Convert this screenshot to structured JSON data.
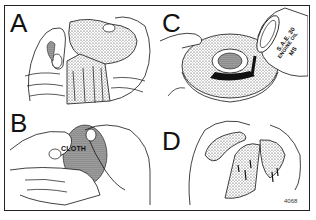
{
  "figure": {
    "panels": [
      {
        "id": "A",
        "letter": "A",
        "description": "Hands wringing out a felt/foam element"
      },
      {
        "id": "B",
        "letter": "B",
        "description": "Hands wrapping element in cloth",
        "callout": "CLOTH"
      },
      {
        "id": "C",
        "letter": "C",
        "description": "Pouring engine oil onto a ring-shaped element",
        "can_text": [
          "S.A.E. 30",
          "ENGINE OIL",
          "MS"
        ]
      },
      {
        "id": "D",
        "letter": "D",
        "description": "Squeezing excess oil out of element"
      }
    ],
    "figure_number": "4068"
  }
}
